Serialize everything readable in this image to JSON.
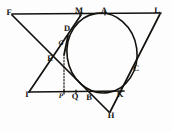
{
  "figure": {
    "width": 172,
    "height": 132,
    "background_color": "#fdfdfd",
    "ink_color": "#14120f"
  },
  "circle": {
    "name": "inscribed-circle",
    "center_x": 102,
    "center_y": 53,
    "radius_x": 35,
    "radius_y": 40,
    "rotation_deg": -8,
    "stroke_color": "#14120f",
    "stroke_width": 1.6
  },
  "points": [
    {
      "id": "F",
      "label": "F",
      "x": 9,
      "y": 12,
      "style": "bold"
    },
    {
      "id": "M",
      "label": "M",
      "x": 79,
      "y": 10,
      "style": "bold"
    },
    {
      "id": "A",
      "label": "A",
      "x": 104,
      "y": 10,
      "style": "bold"
    },
    {
      "id": "L",
      "label": "L",
      "x": 157,
      "y": 10,
      "style": "bold"
    },
    {
      "id": "D",
      "label": "D",
      "x": 67,
      "y": 28,
      "style": "bold"
    },
    {
      "id": "G",
      "label": "G",
      "x": 61,
      "y": 43,
      "style": "italic-small"
    },
    {
      "id": "E",
      "label": "E",
      "x": 50,
      "y": 58,
      "style": "bold"
    },
    {
      "id": "C",
      "label": "C",
      "x": 136,
      "y": 68,
      "style": "bold"
    },
    {
      "id": "I",
      "label": "I",
      "x": 27,
      "y": 94,
      "style": "bold"
    },
    {
      "id": "P",
      "label": "P",
      "x": 61,
      "y": 96,
      "style": "italic-small"
    },
    {
      "id": "Q",
      "label": "Q",
      "x": 75,
      "y": 96,
      "style": "bold"
    },
    {
      "id": "B",
      "label": "B",
      "x": 89,
      "y": 97,
      "style": "bold"
    },
    {
      "id": "K",
      "label": "K",
      "x": 120,
      "y": 94,
      "style": "bold"
    },
    {
      "id": "H",
      "label": "H",
      "x": 111,
      "y": 115,
      "style": "bold"
    }
  ],
  "segments": [
    {
      "id": "FL",
      "name": "top-line-F-to-L",
      "x1": 12,
      "y1": 14,
      "x2": 161,
      "y2": 13,
      "width": 1.7,
      "dashed": false
    },
    {
      "id": "FH",
      "name": "line-F-to-H",
      "x1": 12,
      "y1": 15,
      "x2": 109,
      "y2": 112,
      "width": 1.7,
      "dashed": false
    },
    {
      "id": "LH",
      "name": "line-L-to-H",
      "x1": 160,
      "y1": 14,
      "x2": 110,
      "y2": 112,
      "width": 1.7,
      "dashed": false
    },
    {
      "id": "IK",
      "name": "bottom-line-I-to-K",
      "x1": 29,
      "y1": 92,
      "x2": 124,
      "y2": 91,
      "width": 1.7,
      "dashed": false
    },
    {
      "id": "IM",
      "name": "line-I-to-M",
      "x1": 29,
      "y1": 92,
      "x2": 81,
      "y2": 15,
      "width": 1.7,
      "dashed": false
    },
    {
      "id": "DG",
      "name": "segment-D-to-G-chord",
      "x1": 68,
      "y1": 36,
      "x2": 64,
      "y2": 55,
      "width": 1.8,
      "dashed": false
    },
    {
      "id": "GP",
      "name": "dashed-perpendicular-G-to-P",
      "x1": 64,
      "y1": 57,
      "x2": 64,
      "y2": 91,
      "width": 1.1,
      "dashed": true
    }
  ],
  "ticks": [
    {
      "id": "tick-M",
      "name": "tangent-tick-M",
      "x": 80,
      "y": 14
    },
    {
      "id": "tick-A",
      "name": "tangent-tick-A",
      "x": 105,
      "y": 13
    },
    {
      "id": "tick-Q",
      "name": "tangent-tick-Q",
      "x": 76,
      "y": 92
    },
    {
      "id": "tick-P",
      "name": "tangent-tick-P",
      "x": 64,
      "y": 92
    }
  ]
}
